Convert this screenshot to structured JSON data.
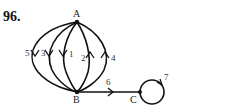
{
  "problem": {
    "number": "96."
  },
  "graph": {
    "vertices": [
      {
        "id": "A",
        "label": "A"
      },
      {
        "id": "B",
        "label": "B"
      },
      {
        "id": "C",
        "label": "C"
      }
    ],
    "edges": [
      {
        "id": "1",
        "label": "1",
        "from": "A",
        "to": "B",
        "type": "arc"
      },
      {
        "id": "2",
        "label": "2",
        "from": "B",
        "to": "A",
        "type": "arc"
      },
      {
        "id": "3",
        "label": "3",
        "from": "A",
        "to": "B",
        "type": "arc"
      },
      {
        "id": "4",
        "label": "4",
        "from": "B",
        "to": "A",
        "type": "arc"
      },
      {
        "id": "5",
        "label": "5",
        "from": "A",
        "to": "B",
        "type": "arc"
      },
      {
        "id": "6",
        "label": "6",
        "from": "B",
        "to": "C",
        "type": "straight"
      },
      {
        "id": "7",
        "label": "7",
        "from": "C",
        "to": "C",
        "type": "loop"
      }
    ]
  },
  "colors": {
    "ink": "#111111",
    "background": "#ffffff"
  }
}
